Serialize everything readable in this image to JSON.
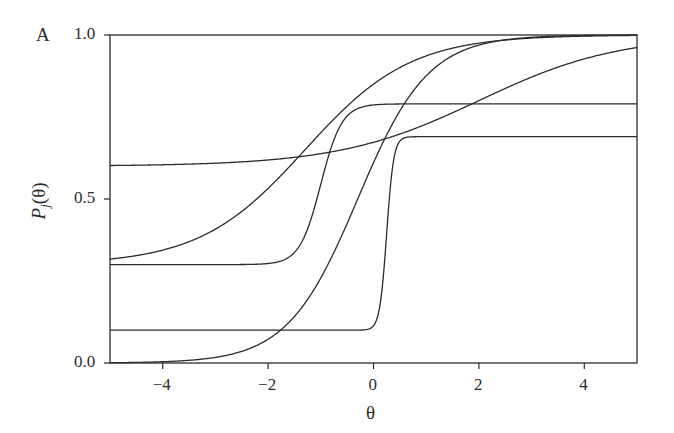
{
  "chart_data": {
    "type": "line",
    "panel_label": "A",
    "title": "",
    "xlabel": "θ",
    "ylabel": "P_j(θ)",
    "ylabel_parts": {
      "P": "P",
      "sub": "j",
      "arg": "(θ)"
    },
    "xlim": [
      -5,
      5
    ],
    "ylim": [
      0,
      1
    ],
    "xticks": [
      -4,
      -2,
      0,
      2,
      4
    ],
    "xtick_labels": [
      "−4",
      "−2",
      "0",
      "2",
      "4"
    ],
    "yticks": [
      0.0,
      0.5,
      1.0
    ],
    "ytick_labels": [
      "0.0",
      "0.5",
      "1.0"
    ],
    "grid": false,
    "legend": null,
    "model": "P(θ) = c + (d − c) / (1 + exp(−a(θ − b)))",
    "series": [
      {
        "name": "item-1 (2PL)",
        "a": 1.5,
        "b": -0.3,
        "c": 0.0,
        "d": 1.0,
        "x": [
          -5,
          -4,
          -3,
          -2,
          -1,
          0,
          1,
          2,
          3,
          4,
          5
        ],
        "values": [
          0.001,
          0.004,
          0.017,
          0.072,
          0.259,
          0.611,
          0.875,
          0.969,
          0.993,
          0.998,
          1.0
        ]
      },
      {
        "name": "item-2 (3PL, c=0.3)",
        "a": 1.0,
        "b": -1.3,
        "c": 0.3,
        "d": 1.0,
        "x": [
          -5,
          -4,
          -3,
          -2,
          -1,
          0,
          1,
          2,
          3,
          4,
          5
        ],
        "values": [
          0.317,
          0.345,
          0.42,
          0.572,
          0.699,
          0.867,
          0.952,
          0.983,
          0.994,
          0.998,
          0.999
        ]
      },
      {
        "name": "item-3 (3PL, c=0.6)",
        "a": 0.75,
        "b": 2.0,
        "c": 0.6,
        "d": 1.0,
        "x": [
          -5,
          -4,
          -3,
          -2,
          -1,
          0,
          1,
          2,
          3,
          4,
          5
        ],
        "values": [
          0.602,
          0.604,
          0.609,
          0.619,
          0.64,
          0.678,
          0.741,
          0.8,
          0.87,
          0.926,
          0.962
        ]
      },
      {
        "name": "item-4 (4PL, c=0.3, d=0.79)",
        "a": 5.0,
        "b": -1.0,
        "c": 0.3,
        "d": 0.79,
        "x": [
          -5,
          -4,
          -3,
          -2,
          -1,
          0,
          1,
          2,
          3,
          4,
          5
        ],
        "values": [
          0.3,
          0.3,
          0.3,
          0.303,
          0.545,
          0.787,
          0.79,
          0.79,
          0.79,
          0.79,
          0.79
        ]
      },
      {
        "name": "item-5 (4PL, c=0.1, d=0.69)",
        "a": 15.0,
        "b": 0.25,
        "c": 0.1,
        "d": 0.69,
        "x": [
          -5,
          -4,
          -3,
          -2,
          -1,
          0,
          1,
          2,
          3,
          4,
          5
        ],
        "values": [
          0.1,
          0.1,
          0.1,
          0.1,
          0.1,
          0.113,
          0.69,
          0.69,
          0.69,
          0.69,
          0.69
        ]
      }
    ],
    "line_color": "#2b2b2b"
  }
}
